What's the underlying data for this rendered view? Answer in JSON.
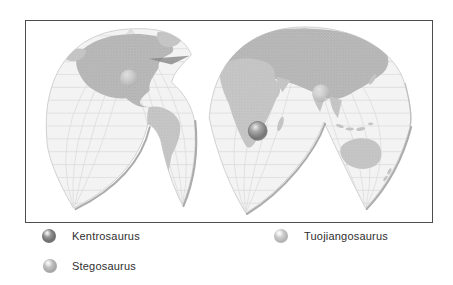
{
  "figure": {
    "kind": "interrupted-projection world map",
    "frame_border_color": "#4d4d4d",
    "ocean_color": "#f3f3f3",
    "land_color": "#c7c7c7",
    "grid_color": "#dadada"
  },
  "legend": {
    "items": [
      {
        "label": "Kentrosaurus",
        "marker": "sphere",
        "color": "#787878"
      },
      {
        "label": "Stegosaurus",
        "marker": "sphere",
        "color": "#ababab"
      },
      {
        "label": "Tuojiangosaurus",
        "marker": "sphere",
        "color": "#bcbcbc"
      }
    ]
  },
  "map": {
    "markers": [
      {
        "species": "Kentrosaurus",
        "region": "East Africa",
        "style": "dark sphere, large"
      },
      {
        "species": "Stegosaurus",
        "region": "western North America",
        "style": "light sphere, faint"
      },
      {
        "species": "Tuojiangosaurus",
        "region": "China",
        "style": "light sphere, faint"
      }
    ]
  }
}
